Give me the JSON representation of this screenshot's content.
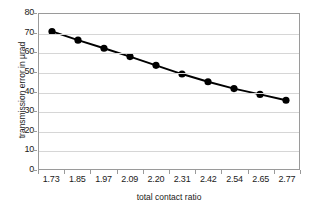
{
  "chart_data": {
    "type": "line",
    "title": "",
    "xlabel": "total contact ratio",
    "ylabel": "transmission error in µrad",
    "categories": [
      "1.73",
      "1.85",
      "1.97",
      "2.09",
      "2.20",
      "2.31",
      "2.42",
      "2.54",
      "2.65",
      "2.77"
    ],
    "values": [
      71.0,
      66.5,
      62.3,
      58.0,
      53.5,
      49.0,
      45.0,
      41.5,
      38.5,
      35.5
    ],
    "series": [
      {
        "name": "transmission error",
        "values": [
          71.0,
          66.5,
          62.3,
          58.0,
          53.5,
          49.0,
          45.0,
          41.5,
          38.5,
          35.5
        ]
      }
    ],
    "ylim": [
      0,
      80
    ],
    "ytick_labels": [
      "0",
      "10",
      "20",
      "30",
      "40",
      "50",
      "60",
      "70",
      "80"
    ],
    "ytick_values": [
      0,
      10,
      20,
      30,
      40,
      50,
      60,
      70,
      80
    ],
    "grid": "horizontal",
    "legend": "none",
    "marker": "filled-circle",
    "colors": {
      "series_line": "#000000",
      "marker": "#000000",
      "gridline": "#d6d6d6",
      "axis_border": "#9a9a9a",
      "plot_background": "#ffffff",
      "text": "#1a1a1a"
    }
  }
}
